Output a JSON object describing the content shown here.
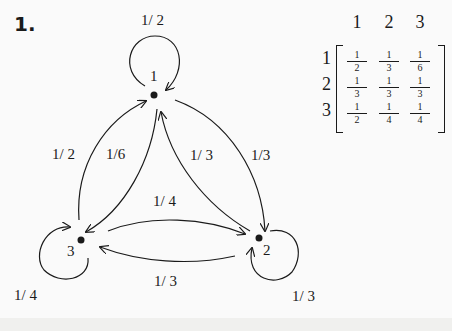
{
  "problem": {
    "number": "1."
  },
  "graph": {
    "nodes": [
      {
        "id": "1",
        "label": "1"
      },
      {
        "id": "2",
        "label": "2"
      },
      {
        "id": "3",
        "label": "3"
      }
    ],
    "edges": [
      {
        "from": "1",
        "to": "1",
        "label": "1/ 2"
      },
      {
        "from": "1",
        "to": "2",
        "label": "1/3"
      },
      {
        "from": "1",
        "to": "3",
        "label": "1/6"
      },
      {
        "from": "2",
        "to": "1",
        "label": "1/ 3"
      },
      {
        "from": "2",
        "to": "2",
        "label": "1/ 3"
      },
      {
        "from": "2",
        "to": "3",
        "label": "1/ 3"
      },
      {
        "from": "3",
        "to": "1",
        "label": "1/ 2"
      },
      {
        "from": "3",
        "to": "2",
        "label": "1/ 4"
      },
      {
        "from": "3",
        "to": "3",
        "label": "1/ 4"
      }
    ]
  },
  "matrix": {
    "col_headers": [
      "1",
      "2",
      "3"
    ],
    "row_headers": [
      "1",
      "2",
      "3"
    ],
    "rows": [
      [
        {
          "n": "1",
          "d": "2"
        },
        {
          "n": "1",
          "d": "3"
        },
        {
          "n": "1",
          "d": "6"
        }
      ],
      [
        {
          "n": "1",
          "d": "3"
        },
        {
          "n": "1",
          "d": "3"
        },
        {
          "n": "1",
          "d": "3"
        }
      ],
      [
        {
          "n": "1",
          "d": "2"
        },
        {
          "n": "1",
          "d": "4"
        },
        {
          "n": "1",
          "d": "4"
        }
      ]
    ]
  }
}
